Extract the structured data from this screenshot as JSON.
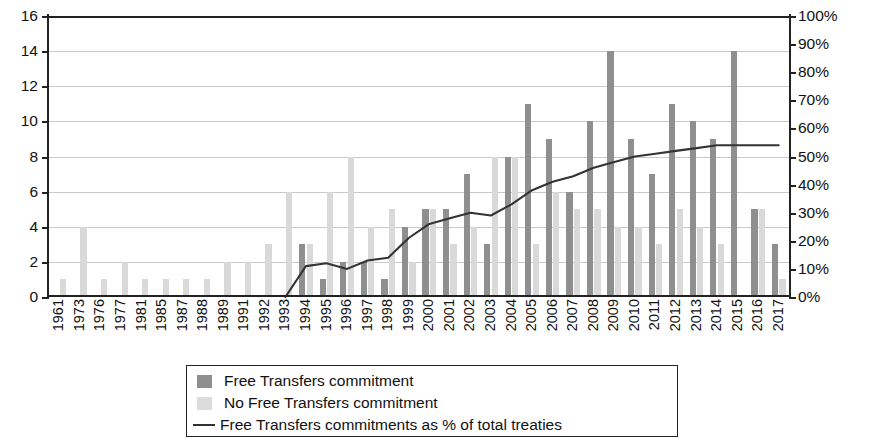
{
  "chart_data": {
    "type": "bar",
    "title": "",
    "subtitle": "",
    "xlabel": "",
    "ylabel": "",
    "y2label": "",
    "grid": true,
    "legend_position": "bottom",
    "ylim": [
      0,
      16
    ],
    "y_ticks": [
      "0",
      "2",
      "4",
      "6",
      "8",
      "10",
      "12",
      "14",
      "16"
    ],
    "y2lim": [
      0,
      100
    ],
    "y2_ticks": [
      "0%",
      "10%",
      "20%",
      "30%",
      "40%",
      "50%",
      "60%",
      "70%",
      "80%",
      "90%",
      "100%"
    ],
    "categories": [
      "1961",
      "1973",
      "1976",
      "1977",
      "1981",
      "1985",
      "1987",
      "1988",
      "1989",
      "1991",
      "1992",
      "1993",
      "1994",
      "1995",
      "1996",
      "1997",
      "1998",
      "1999",
      "2000",
      "2001",
      "2002",
      "2003",
      "2004",
      "2005",
      "2006",
      "2007",
      "2008",
      "2009",
      "2010",
      "2011",
      "2012",
      "2013",
      "2014",
      "2015",
      "2016",
      "2017"
    ],
    "series": [
      {
        "name": "Free Transfers commitment",
        "type": "bar",
        "color": "#8f8f8f",
        "axis": "left",
        "values": [
          0,
          0,
          0,
          0,
          0,
          0,
          0,
          0,
          0,
          0,
          0,
          0,
          3,
          1,
          2,
          2,
          1,
          4,
          5,
          5,
          7,
          3,
          8,
          11,
          9,
          6,
          10,
          14,
          9,
          7,
          11,
          10,
          9,
          14,
          5,
          3
        ]
      },
      {
        "name": "No Free Transfers commitment",
        "type": "bar",
        "color": "#d9d9d9",
        "axis": "left",
        "values": [
          1,
          4,
          1,
          2,
          1,
          1,
          1,
          1,
          2,
          2,
          3,
          6,
          3,
          6,
          8,
          4,
          5,
          2,
          5,
          3,
          4,
          8,
          8,
          3,
          6,
          5,
          5,
          4,
          4,
          3,
          5,
          4,
          3,
          0,
          5,
          1
        ]
      },
      {
        "name": "Free Transfers commitments as % of total treaties",
        "type": "line",
        "color": "#333333",
        "axis": "right",
        "values": [
          null,
          null,
          null,
          null,
          null,
          null,
          null,
          null,
          null,
          null,
          null,
          0,
          11,
          12,
          10,
          13,
          14,
          21,
          26,
          28,
          30,
          29,
          33,
          38,
          41,
          43,
          46,
          48,
          50,
          51,
          52,
          53,
          54,
          54,
          54,
          54
        ]
      }
    ],
    "legend": [
      {
        "marker": "swatch-dark",
        "label": "Free Transfers commitment"
      },
      {
        "marker": "swatch-light",
        "label": "No Free Transfers commitment"
      },
      {
        "marker": "line",
        "label": "Free Transfers commitments as % of total treaties"
      }
    ]
  }
}
